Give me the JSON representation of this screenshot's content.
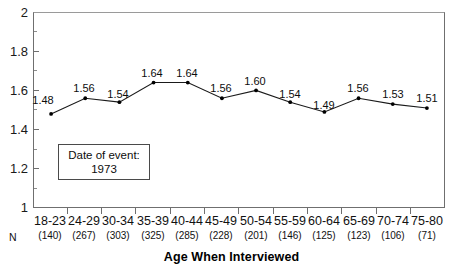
{
  "chart_data": {
    "type": "line",
    "title": "",
    "xlabel": "Age When Interviewed",
    "ylabel": "",
    "ylim": [
      1,
      2
    ],
    "yticks": [
      1,
      1.2,
      1.4,
      1.6,
      1.8,
      2
    ],
    "ytick_labels": [
      "1",
      "1.2",
      "1.4",
      "1.6",
      "1.8",
      "2"
    ],
    "grid": false,
    "legend": "none",
    "categories": [
      "18-23",
      "24-29",
      "30-34",
      "35-39",
      "40-44",
      "45-49",
      "50-54",
      "55-59",
      "60-64",
      "65-69",
      "70-74",
      "75-80"
    ],
    "values": [
      1.48,
      1.56,
      1.54,
      1.64,
      1.64,
      1.56,
      1.6,
      1.54,
      1.49,
      1.56,
      1.53,
      1.51
    ],
    "point_labels": [
      "1.48",
      "1.56",
      "1.54",
      "1.64",
      "1.64",
      "1.56",
      "1.60",
      "1.54",
      "1.49",
      "1.56",
      "1.53",
      "1.51"
    ],
    "n_label": "N",
    "n_counts": [
      "(140)",
      "(267)",
      "(303)",
      "(325)",
      "(285)",
      "(228)",
      "(201)",
      "(146)",
      "(125)",
      "(123)",
      "(106)",
      "(71)"
    ],
    "annotation": {
      "line1": "Date of event:",
      "line2": "1973"
    },
    "colors": {
      "line": "#1a1a1a",
      "marker": "#000000",
      "axis": "#6f6f6f",
      "text": "#000000",
      "background": "#ffffff"
    }
  }
}
